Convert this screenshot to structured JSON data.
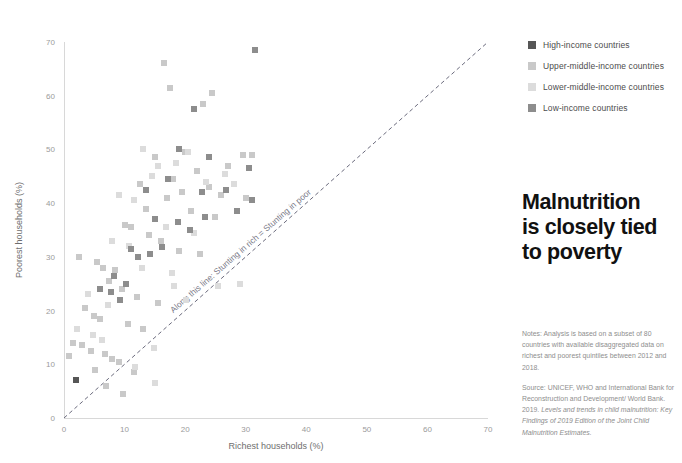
{
  "headline": {
    "lines": [
      "Malnutrition",
      "is closely tied",
      "to poverty"
    ]
  },
  "legend": {
    "items": [
      {
        "label": "High-income countries",
        "color": "#565656"
      },
      {
        "label": "Upper-middle-income countries",
        "color": "#c9c9c9"
      },
      {
        "label": "Lower-middle-income countries",
        "color": "#dcdcdc"
      },
      {
        "label": "Low-income countries",
        "color": "#8d8d8d"
      }
    ]
  },
  "notes": {
    "analysis": "Notes: Analysis is based on a subset of 80 countries with available disaggregated data on richest and poorest quintiles between 2012 and 2018.",
    "source_plain": "Source: UNICEF, WHO and International Bank for Reconstruction and Development/ World Bank. 2019. ",
    "source_italic": "Levels and trends in child malnutrition: Key Findings of 2019 Edition of the Joint Child Malnutrition Estimates."
  },
  "chart_data": {
    "type": "scatter",
    "title": "",
    "xlabel": "Richest households (%)",
    "ylabel": "Poorest households (%)",
    "xlim": [
      0,
      70
    ],
    "ylim": [
      0,
      70
    ],
    "xticks": [
      0,
      10,
      20,
      30,
      40,
      50,
      60,
      70
    ],
    "yticks": [
      0,
      10,
      20,
      30,
      40,
      50,
      60,
      70
    ],
    "grid": false,
    "legend_position": "top-right-outside",
    "annotations": [
      {
        "text": "Along this line: Stunting in rich = Stunting in poor",
        "type": "reference-line-label",
        "x": 30,
        "y": 30,
        "rotation_deg": -41
      }
    ],
    "reference_line": {
      "style": "dashed",
      "from": [
        0,
        0
      ],
      "to": [
        70,
        70
      ],
      "color": "#6b6b7d",
      "label": "Along this line: Stunting in rich = Stunting in poor"
    },
    "series": [
      {
        "name": "High-income countries",
        "color": "#565656",
        "points": [
          [
            2.0,
            7.0
          ]
        ]
      },
      {
        "name": "Upper-middle-income countries",
        "color": "#c9c9c9",
        "points": [
          [
            16.5,
            66.0
          ],
          [
            17.5,
            61.5
          ],
          [
            23.0,
            58.5
          ],
          [
            24.5,
            60.5
          ],
          [
            15.0,
            48.5
          ],
          [
            18.0,
            44.5
          ],
          [
            22.0,
            46.0
          ],
          [
            27.0,
            47.0
          ],
          [
            31.0,
            49.0
          ],
          [
            29.5,
            49.0
          ],
          [
            12.5,
            43.5
          ],
          [
            13.5,
            39.0
          ],
          [
            17.0,
            41.0
          ],
          [
            19.5,
            42.0
          ],
          [
            21.0,
            38.5
          ],
          [
            25.0,
            37.5
          ],
          [
            10.0,
            36.0
          ],
          [
            11.0,
            35.5
          ],
          [
            14.0,
            34.0
          ],
          [
            16.0,
            33.0
          ],
          [
            19.0,
            31.0
          ],
          [
            22.5,
            30.5
          ],
          [
            2.5,
            30.0
          ],
          [
            5.5,
            29.0
          ],
          [
            6.5,
            28.0
          ],
          [
            8.5,
            27.5
          ],
          [
            7.5,
            25.5
          ],
          [
            9.5,
            24.0
          ],
          [
            12.0,
            22.5
          ],
          [
            15.5,
            21.5
          ],
          [
            3.5,
            20.5
          ],
          [
            5.0,
            19.0
          ],
          [
            6.0,
            18.5
          ],
          [
            10.5,
            17.5
          ],
          [
            13.0,
            16.5
          ],
          [
            1.5,
            14.0
          ],
          [
            3.0,
            13.5
          ],
          [
            4.5,
            12.5
          ],
          [
            6.8,
            12.0
          ],
          [
            0.8,
            11.5
          ],
          [
            8.0,
            11.0
          ],
          [
            9.0,
            10.5
          ],
          [
            5.2,
            9.0
          ],
          [
            11.5,
            8.5
          ],
          [
            7.0,
            6.0
          ],
          [
            9.8,
            4.5
          ],
          [
            20.0,
            49.5
          ],
          [
            24.0,
            43.0
          ],
          [
            26.0,
            41.5
          ],
          [
            30.0,
            41.0
          ]
        ]
      },
      {
        "name": "Lower-middle-income countries",
        "color": "#dcdcdc",
        "points": [
          [
            13.0,
            50.0
          ],
          [
            15.5,
            47.0
          ],
          [
            20.5,
            49.5
          ],
          [
            26.5,
            45.5
          ],
          [
            9.0,
            41.5
          ],
          [
            11.5,
            40.5
          ],
          [
            14.5,
            45.0
          ],
          [
            18.5,
            47.5
          ],
          [
            23.5,
            44.0
          ],
          [
            28.0,
            43.5
          ],
          [
            8.0,
            33.0
          ],
          [
            10.8,
            32.0
          ],
          [
            16.8,
            35.5
          ],
          [
            21.5,
            34.5
          ],
          [
            4.0,
            23.0
          ],
          [
            7.2,
            21.0
          ],
          [
            12.8,
            28.0
          ],
          [
            17.8,
            27.0
          ],
          [
            2.2,
            16.5
          ],
          [
            4.8,
            15.5
          ],
          [
            6.2,
            14.5
          ],
          [
            14.8,
            13.0
          ],
          [
            11.8,
            9.5
          ],
          [
            15.0,
            6.5
          ],
          [
            18.2,
            24.5
          ],
          [
            20.2,
            22.0
          ],
          [
            25.5,
            24.5
          ],
          [
            29.0,
            25.0
          ]
        ]
      },
      {
        "name": "Low-income countries",
        "color": "#8d8d8d",
        "points": [
          [
            31.5,
            68.5
          ],
          [
            21.5,
            57.5
          ],
          [
            19.0,
            50.0
          ],
          [
            24.0,
            48.5
          ],
          [
            30.5,
            46.5
          ],
          [
            13.5,
            42.5
          ],
          [
            15.0,
            37.0
          ],
          [
            17.2,
            44.5
          ],
          [
            22.8,
            42.0
          ],
          [
            26.8,
            42.5
          ],
          [
            28.5,
            38.5
          ],
          [
            11.0,
            31.5
          ],
          [
            12.2,
            30.0
          ],
          [
            16.2,
            31.8
          ],
          [
            18.8,
            36.5
          ],
          [
            20.8,
            35.0
          ],
          [
            8.2,
            26.5
          ],
          [
            10.2,
            25.0
          ],
          [
            14.2,
            30.5
          ],
          [
            23.2,
            37.5
          ],
          [
            6.0,
            24.0
          ],
          [
            7.8,
            23.5
          ],
          [
            9.2,
            22.0
          ],
          [
            31.0,
            40.5
          ]
        ]
      }
    ]
  }
}
